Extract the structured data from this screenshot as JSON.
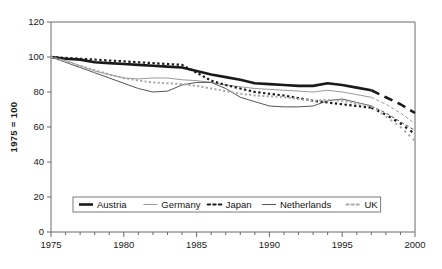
{
  "chart_data": {
    "type": "line",
    "title": "",
    "xlabel": "",
    "ylabel": "1975 = 100",
    "xlim": [
      1975,
      2000
    ],
    "ylim": [
      0,
      120
    ],
    "grid": false,
    "legend_position": "bottom-center",
    "y_ticks": [
      "0",
      "20",
      "40",
      "60",
      "80",
      "100",
      "120"
    ],
    "y_tick_values": [
      0,
      20,
      40,
      60,
      80,
      100,
      120
    ],
    "x_ticks": [
      "1975",
      "1980",
      "1985",
      "1990",
      "1995",
      "2000"
    ],
    "x_tick_values": [
      1975,
      1980,
      1985,
      1990,
      1995,
      2000
    ],
    "x_minor_step": 1,
    "note": "Solid portion 1975-1997 observed; 1997-2000 drawn as dashed projection for all series",
    "projection_start_year": 1997,
    "x": [
      1975,
      1976,
      1977,
      1978,
      1979,
      1980,
      1981,
      1982,
      1983,
      1984,
      1985,
      1986,
      1987,
      1988,
      1989,
      1990,
      1991,
      1992,
      1993,
      1994,
      1995,
      1996,
      1997,
      1998,
      1999,
      2000
    ],
    "series": [
      {
        "name": "Austria",
        "style": "thick-solid",
        "color": "#1a1a1a",
        "width": 2.6,
        "values": [
          100,
          99,
          98.5,
          97,
          96.5,
          96,
          95.5,
          95,
          94.5,
          94,
          92,
          90,
          88.5,
          87,
          85,
          84.5,
          84,
          83.5,
          83.5,
          85,
          84,
          82.5,
          81,
          77,
          73,
          68
        ]
      },
      {
        "name": "Germany",
        "style": "thin-solid",
        "color": "#9a9a9a",
        "width": 1.0,
        "values": [
          100,
          98,
          95,
          92,
          90,
          88,
          87.5,
          88,
          88,
          87,
          86.5,
          85.5,
          84,
          83,
          82,
          81.5,
          81,
          80.5,
          80,
          81,
          80,
          78.5,
          77,
          73,
          68,
          62
        ]
      },
      {
        "name": "Japan",
        "style": "dotted",
        "color": "#1a1a1a",
        "width": 2.2,
        "values": [
          100,
          99.5,
          99,
          98.5,
          98,
          97.5,
          97,
          96.5,
          96,
          95.5,
          91,
          86.5,
          84,
          82,
          80,
          79,
          78,
          76.5,
          75,
          74,
          73,
          72,
          71,
          67,
          62,
          56
        ]
      },
      {
        "name": "Netherlands",
        "style": "thin-solid",
        "color": "#555555",
        "width": 1.0,
        "values": [
          100,
          97,
          94,
          91,
          88,
          85,
          82,
          80,
          80.5,
          84,
          85.5,
          85.5,
          82,
          77,
          74.5,
          72,
          71.5,
          71.5,
          72,
          75,
          76,
          74,
          72,
          68,
          63,
          58
        ]
      },
      {
        "name": "UK",
        "style": "dotted",
        "color": "#a8a8a8",
        "width": 2.0,
        "values": [
          100,
          97.5,
          95,
          92.5,
          90,
          88,
          86.5,
          85.5,
          85,
          84.5,
          83.5,
          82,
          80.5,
          79,
          78,
          77.5,
          77,
          76,
          75,
          75.5,
          75,
          73.5,
          72,
          66,
          60,
          52
        ]
      }
    ]
  },
  "legend": {
    "items": [
      {
        "label": "Austria"
      },
      {
        "label": "Germany"
      },
      {
        "label": "Japan"
      },
      {
        "label": "Netherlands"
      },
      {
        "label": "UK"
      }
    ]
  }
}
